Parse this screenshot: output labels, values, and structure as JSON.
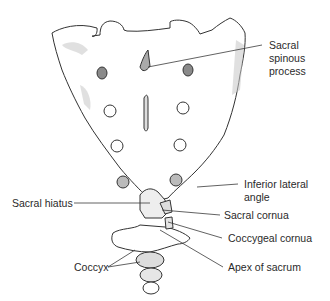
{
  "figure": {
    "colors": {
      "outline": "#333333",
      "bone_fill": "#ffffff",
      "shade": "#c8c8c8",
      "dark_shade": "#8a8a8a",
      "label_text": "#2a2a2a",
      "leader_line": "#3a3a3a"
    }
  },
  "labels": {
    "sacral_spinous_process": [
      "Sacral",
      "spinous",
      "process"
    ],
    "inferior_lateral_angle": [
      "Inferior lateral",
      "angle"
    ],
    "sacral_hiatus": "Sacral hiatus",
    "sacral_cornua": "Sacral cornua",
    "coccygeal_cornua": "Coccygeal cornua",
    "coccyx": "Coccyx",
    "apex_of_sacrum": "Apex of sacrum"
  }
}
